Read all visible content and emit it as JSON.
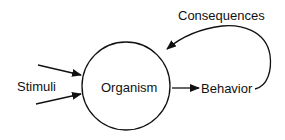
{
  "diagram": {
    "type": "flow",
    "nodes": [
      {
        "id": "stimuli",
        "label": "Stimuli"
      },
      {
        "id": "organism",
        "label": "Organism",
        "shape": "circle"
      },
      {
        "id": "behavior",
        "label": "Behavior"
      },
      {
        "id": "consequences",
        "label": "Consequences"
      }
    ],
    "edges": [
      {
        "from": "stimuli",
        "to": "organism"
      },
      {
        "from": "stimuli",
        "to": "organism"
      },
      {
        "from": "organism",
        "to": "behavior"
      },
      {
        "from": "behavior",
        "to": "organism",
        "label": "Consequences",
        "style": "curved"
      }
    ]
  },
  "labels": {
    "stimuli": "Stimuli",
    "organism": "Organism",
    "behavior": "Behavior",
    "consequences": "Consequences"
  },
  "colors": {
    "stroke": "#111111",
    "background": "#ffffff"
  }
}
